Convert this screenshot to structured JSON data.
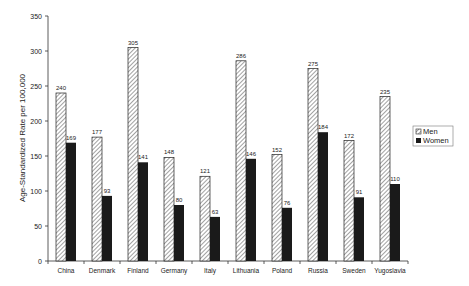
{
  "chart_data": {
    "type": "bar",
    "title": "",
    "xlabel": "",
    "ylabel": "Age-Standardized Rate per 100,000",
    "ylim": [
      0,
      350
    ],
    "yticks": [
      0,
      50,
      100,
      150,
      200,
      250,
      300,
      350
    ],
    "grid": false,
    "legend_position": "right",
    "categories": [
      "China",
      "Denmark",
      "Finland",
      "Germany",
      "Italy",
      "Lithuania",
      "Poland",
      "Russia",
      "Sweden",
      "Yugoslavia"
    ],
    "series": [
      {
        "name": "Men",
        "style": "hatched",
        "color": "#ffffff",
        "values": [
          240,
          177,
          305,
          148,
          121,
          286,
          152,
          275,
          172,
          235
        ]
      },
      {
        "name": "Women",
        "style": "solid",
        "color": "#1a1a1a",
        "values": [
          169,
          93,
          141,
          80,
          63,
          146,
          76,
          184,
          91,
          110
        ]
      }
    ]
  },
  "legend": {
    "men_label": "Men",
    "women_label": "Women"
  },
  "axis": {
    "ylabel": "Age-Standardized Rate per 100,000"
  }
}
